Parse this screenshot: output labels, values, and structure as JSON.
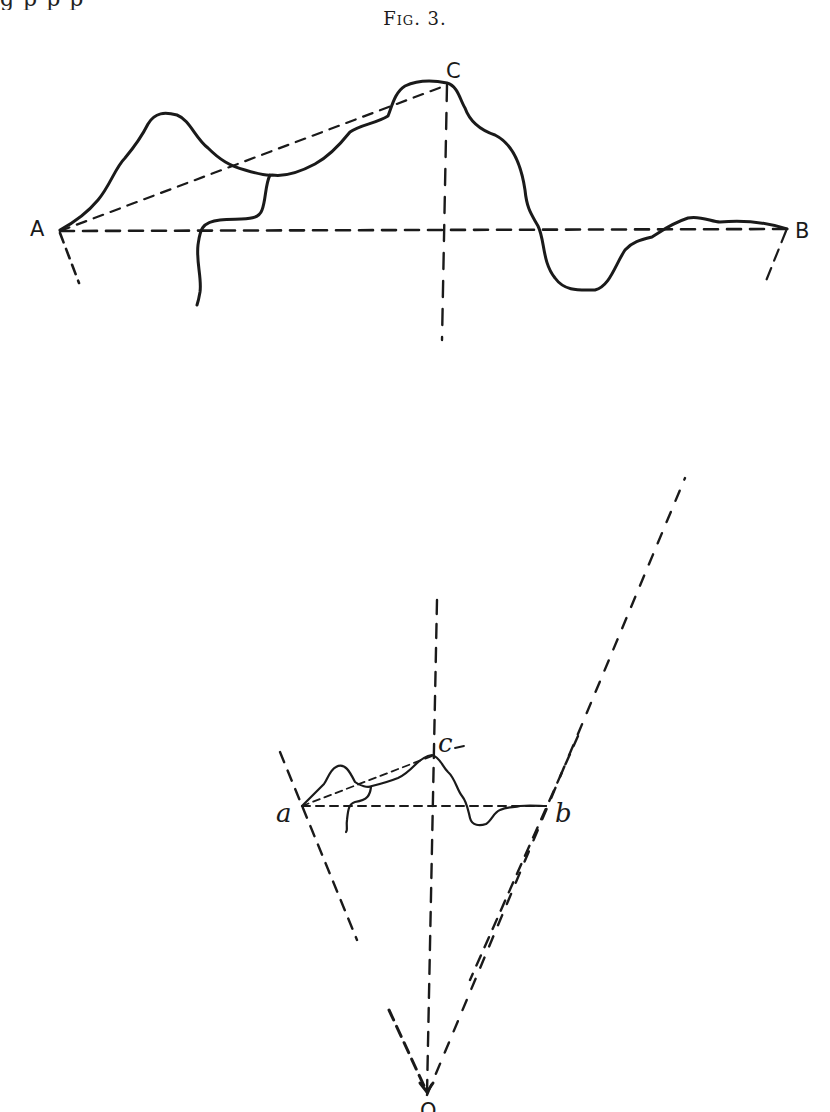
{
  "page": {
    "top_cut_text": "g                                   p p                                         p",
    "caption": "Fig. 3."
  },
  "diagram": {
    "type": "geometric perspective projection",
    "upper_figure": {
      "labels": {
        "A": "A",
        "B": "B",
        "C": "C"
      },
      "points": {
        "A": [
          60,
          231
        ],
        "B": [
          787,
          229
        ],
        "C": [
          447,
          85
        ]
      },
      "elements": [
        "irregular profile curve",
        "dashed baseline A-B",
        "dashed chord A-C",
        "dashed vertical through C",
        "dashed rays toward O from A and B"
      ]
    },
    "lower_figure": {
      "labels": {
        "a": "a",
        "b": "b",
        "c": "c",
        "O": "O"
      },
      "points": {
        "a": [
          302,
          806
        ],
        "b": [
          546,
          806
        ],
        "c": [
          432,
          756
        ],
        "O": [
          427,
          1097
        ]
      },
      "elements": [
        "reduced profile curve",
        "dashed baseline a-b",
        "dashed chord a-c",
        "dashed vertical through c to O",
        "dashed rays O-a and O-b extended"
      ]
    },
    "line_color": "#1a1a1a"
  }
}
